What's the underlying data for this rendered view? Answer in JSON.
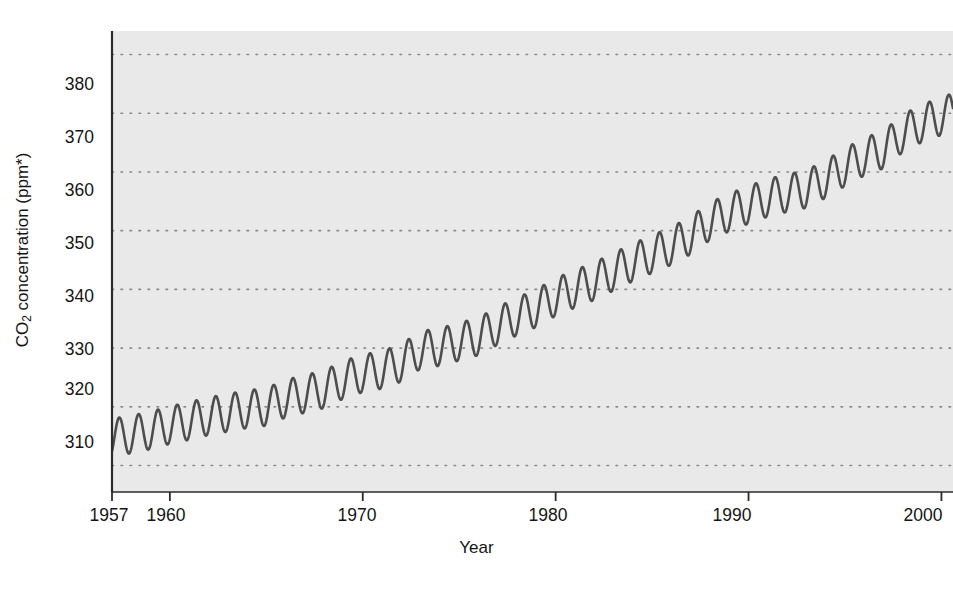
{
  "chart_data": {
    "type": "line",
    "title": "",
    "subtitle": "",
    "xlabel": "Year",
    "ylabel": "CO2 concentration (ppm*)",
    "ylabel_parts": {
      "prefix": "CO",
      "sub": "2",
      "suffix": " concentration (ppm*)"
    },
    "xlim": [
      1957,
      2000.6
    ],
    "ylim": [
      305.5,
      384.0
    ],
    "grid": true,
    "grid_style": "dotted-horizontal",
    "legend": "none",
    "xticks": [
      1957,
      1960,
      1970,
      1980,
      1990,
      2000
    ],
    "xtick_labels": [
      "1957",
      "1960",
      "1970",
      "1980",
      "1990",
      "2000"
    ],
    "yticks": [
      310,
      320,
      330,
      340,
      350,
      360,
      370,
      380
    ],
    "ytick_labels": [
      "310",
      "320",
      "330",
      "340",
      "350",
      "360",
      "370",
      "380"
    ],
    "series": [
      {
        "name": "Atmospheric CO2 concentration (Mauna Loa)",
        "color": "#4a4a4a",
        "annual_cycle_amplitude_ppm": 3.2,
        "seasonal_peak_month": "May",
        "seasonal_trough_month": "October",
        "x": [
          1957,
          1958,
          1959,
          1960,
          1961,
          1962,
          1963,
          1964,
          1965,
          1966,
          1967,
          1968,
          1969,
          1970,
          1971,
          1972,
          1973,
          1974,
          1975,
          1976,
          1977,
          1978,
          1979,
          1980,
          1981,
          1982,
          1983,
          1984,
          1985,
          1986,
          1987,
          1988,
          1989,
          1990,
          1991,
          1992,
          1993,
          1994,
          1995,
          1996,
          1997,
          1998,
          1999,
          2000
        ],
        "annual_mean_values": [
          314.8,
          315.3,
          316.0,
          316.9,
          317.6,
          318.4,
          319.0,
          319.6,
          320.0,
          321.4,
          322.2,
          323.0,
          324.6,
          325.7,
          326.3,
          327.5,
          329.7,
          330.2,
          331.1,
          332.0,
          333.8,
          335.4,
          336.8,
          338.7,
          340.1,
          341.4,
          343.0,
          344.6,
          346.0,
          347.4,
          349.2,
          351.6,
          353.1,
          354.4,
          355.6,
          356.4,
          357.1,
          358.8,
          360.8,
          362.6,
          363.8,
          366.6,
          368.3,
          369.5
        ]
      }
    ],
    "axis_footnote_marker": "*",
    "plot_bg_color": "#e9e9e9",
    "line_color": "#4d4d4d",
    "grid_color": "#8a8a8a",
    "axis_color": "#2b2b2b"
  },
  "figure": {
    "plot_left_px": 112,
    "plot_top_px": 31,
    "plot_right_px": 953,
    "plot_bottom_px": 492
  }
}
